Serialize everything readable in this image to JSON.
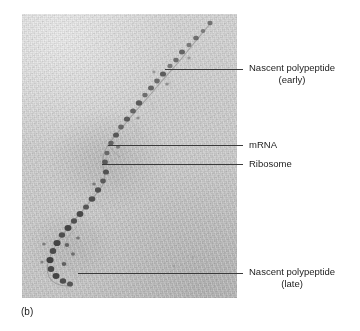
{
  "figure": {
    "panel_letter": "(b)",
    "type": "electron-micrograph"
  },
  "micrograph": {
    "name": "polysome-electron-micrograph",
    "background_color": "#d4d4d4",
    "grain": "fine film grain",
    "frame": {
      "left": 22,
      "top": 14,
      "width": 215,
      "height": 284
    }
  },
  "callouts": [
    {
      "id": "nascent-polypeptide-early",
      "line1": "Nascent polypeptide",
      "line2": "(early)",
      "leader": {
        "x1": 165,
        "y1": 69,
        "x2": 243,
        "y2": 69
      },
      "text_x": 249,
      "text_y": 62
    },
    {
      "id": "mrna",
      "line1": "mRNA",
      "line2": "",
      "leader": {
        "x1": 108,
        "y1": 145,
        "x2": 243,
        "y2": 145
      },
      "text_x": 249,
      "text_y": 139
    },
    {
      "id": "ribosome",
      "line1": "Ribosome",
      "line2": "",
      "leader": {
        "x1": 102,
        "y1": 164,
        "x2": 243,
        "y2": 164
      },
      "text_x": 249,
      "text_y": 158
    },
    {
      "id": "nascent-polypeptide-late",
      "line1": "Nascent polypeptide",
      "line2": "(late)",
      "leader": {
        "x1": 78,
        "y1": 273,
        "x2": 243,
        "y2": 273
      },
      "text_x": 249,
      "text_y": 266
    }
  ],
  "colors": {
    "leader_line": "#3a3a3a",
    "text": "#1c1c1c",
    "ribosome_dark": "#4a4a4a",
    "strand": "#8d8d8d",
    "page_background": "#ffffff"
  }
}
